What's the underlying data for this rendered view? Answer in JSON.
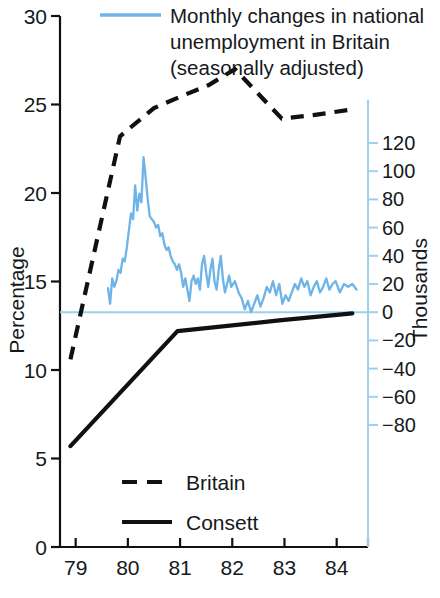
{
  "chart_data": {
    "type": "line",
    "title": "",
    "xlabel": "",
    "ylabel": "Percentage",
    "y2label": "Thousands",
    "xlim": [
      78.7,
      84.6
    ],
    "ylim": [
      0,
      30
    ],
    "y2lim": [
      -90,
      130
    ],
    "grid": false,
    "legend_position": "inside-bottom-left",
    "x_ticks": [
      "79",
      "80",
      "81",
      "82",
      "83",
      "84"
    ],
    "x_tick_values": [
      79,
      80,
      81,
      82,
      83,
      84
    ],
    "y_ticks": [
      "0",
      "5",
      "10",
      "15",
      "20",
      "25",
      "30"
    ],
    "y_tick_values": [
      0,
      5,
      10,
      15,
      20,
      25,
      30
    ],
    "y2_ticks": [
      "120",
      "100",
      "80",
      "60",
      "40",
      "20",
      "0",
      "−20",
      "−40",
      "−60",
      "−80"
    ],
    "y2_tick_values": [
      120,
      100,
      80,
      60,
      40,
      20,
      0,
      -20,
      -40,
      -60,
      -80
    ],
    "annotations": [
      {
        "name": "blue-series-note",
        "lines": [
          "Monthly changes in national",
          "unemployment in Britain",
          "(seasonally adjusted)"
        ],
        "swatch": "line",
        "color": "#6EB4E8"
      }
    ],
    "series": [
      {
        "name": "Britain",
        "axis": "left",
        "style": "dashed",
        "color": "#111111",
        "legend_label": "Britain",
        "points": [
          [
            78.9,
            10.6
          ],
          [
            79.85,
            23.2
          ],
          [
            80.05,
            23.7
          ],
          [
            80.5,
            24.8
          ],
          [
            81.05,
            25.5
          ],
          [
            81.55,
            26.1
          ],
          [
            82.05,
            27.0
          ],
          [
            82.95,
            24.2
          ],
          [
            83.55,
            24.4
          ],
          [
            84.25,
            24.7
          ]
        ]
      },
      {
        "name": "Consett",
        "axis": "left",
        "style": "solid",
        "color": "#111111",
        "legend_label": "Consett",
        "points": [
          [
            78.9,
            5.7
          ],
          [
            80.95,
            12.2
          ],
          [
            82.9,
            12.8
          ],
          [
            84.3,
            13.2
          ]
        ]
      },
      {
        "name": "Monthly changes in national unemployment in Britain (seasonally adjusted)",
        "axis": "right",
        "style": "solid",
        "color": "#6EB4E8",
        "legend_label": "",
        "units": "thousands",
        "values": [
          [
            79.62,
            17
          ],
          [
            79.66,
            6
          ],
          [
            79.7,
            24
          ],
          [
            79.74,
            18
          ],
          [
            79.78,
            22
          ],
          [
            79.82,
            30
          ],
          [
            79.86,
            28
          ],
          [
            79.9,
            38
          ],
          [
            79.94,
            36
          ],
          [
            79.98,
            46
          ],
          [
            80.02,
            58
          ],
          [
            80.06,
            70
          ],
          [
            80.1,
            66
          ],
          [
            80.14,
            90
          ],
          [
            80.18,
            72
          ],
          [
            80.22,
            84
          ],
          [
            80.26,
            78
          ],
          [
            80.3,
            110
          ],
          [
            80.34,
            96
          ],
          [
            80.38,
            80
          ],
          [
            80.42,
            68
          ],
          [
            80.46,
            66
          ],
          [
            80.5,
            64
          ],
          [
            80.54,
            60
          ],
          [
            80.58,
            62
          ],
          [
            80.62,
            54
          ],
          [
            80.66,
            56
          ],
          [
            80.7,
            48
          ],
          [
            80.74,
            44
          ],
          [
            80.78,
            46
          ],
          [
            80.82,
            40
          ],
          [
            80.86,
            36
          ],
          [
            80.9,
            34
          ],
          [
            80.94,
            30
          ],
          [
            80.98,
            34
          ],
          [
            81.02,
            28
          ],
          [
            81.06,
            18
          ],
          [
            81.1,
            24
          ],
          [
            81.14,
            16
          ],
          [
            81.18,
            8
          ],
          [
            81.22,
            22
          ],
          [
            81.26,
            26
          ],
          [
            81.3,
            20
          ],
          [
            81.34,
            24
          ],
          [
            81.38,
            16
          ],
          [
            81.42,
            34
          ],
          [
            81.46,
            40
          ],
          [
            81.5,
            28
          ],
          [
            81.54,
            18
          ],
          [
            81.58,
            30
          ],
          [
            81.62,
            38
          ],
          [
            81.66,
            22
          ],
          [
            81.7,
            16
          ],
          [
            81.74,
            30
          ],
          [
            81.78,
            40
          ],
          [
            81.82,
            24
          ],
          [
            81.86,
            14
          ],
          [
            81.9,
            20
          ],
          [
            81.94,
            26
          ],
          [
            81.98,
            18
          ],
          [
            82.05,
            22
          ],
          [
            82.12,
            14
          ],
          [
            82.18,
            10
          ],
          [
            82.24,
            2
          ],
          [
            82.3,
            8
          ],
          [
            82.36,
            0
          ],
          [
            82.42,
            6
          ],
          [
            82.48,
            12
          ],
          [
            82.54,
            4
          ],
          [
            82.6,
            10
          ],
          [
            82.66,
            18
          ],
          [
            82.72,
            14
          ],
          [
            82.78,
            22
          ],
          [
            82.84,
            12
          ],
          [
            82.9,
            20
          ],
          [
            82.96,
            6
          ],
          [
            83.02,
            12
          ],
          [
            83.08,
            8
          ],
          [
            83.14,
            14
          ],
          [
            83.2,
            20
          ],
          [
            83.26,
            16
          ],
          [
            83.32,
            24
          ],
          [
            83.38,
            18
          ],
          [
            83.44,
            22
          ],
          [
            83.5,
            12
          ],
          [
            83.56,
            18
          ],
          [
            83.62,
            22
          ],
          [
            83.68,
            14
          ],
          [
            83.74,
            18
          ],
          [
            83.8,
            24
          ],
          [
            83.86,
            16
          ],
          [
            83.92,
            20
          ],
          [
            83.98,
            22
          ],
          [
            84.06,
            14
          ],
          [
            84.14,
            20
          ],
          [
            84.22,
            18
          ],
          [
            84.3,
            20
          ],
          [
            84.38,
            16
          ]
        ]
      }
    ]
  },
  "axes": {
    "left_title": "Percentage",
    "right_title": "Thousands"
  },
  "legend": {
    "items": [
      {
        "label": "Britain",
        "style": "dashed"
      },
      {
        "label": "Consett",
        "style": "solid"
      }
    ]
  },
  "colors": {
    "blue": "#6EB4E8",
    "blue_axis": "#9ED0EE",
    "black": "#111111",
    "background": "#ffffff"
  }
}
